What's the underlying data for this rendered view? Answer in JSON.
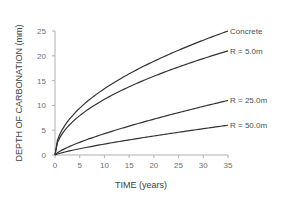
{
  "chart_data": {
    "type": "line",
    "title": "",
    "xlabel": "TIME (years)",
    "ylabel": "DEPTH OF CARBONATION (mm)",
    "xlim": [
      0,
      35
    ],
    "ylim": [
      0,
      25
    ],
    "xticks": [
      0,
      5,
      10,
      15,
      20,
      25,
      30,
      35
    ],
    "yticks": [
      0,
      5,
      10,
      15,
      20,
      25
    ],
    "grid": false,
    "legend_position": "inline labels at right end of curves",
    "x": [
      0,
      1,
      2,
      5,
      10,
      15,
      20,
      25,
      30,
      35
    ],
    "series": [
      {
        "name": "Concrete",
        "values": [
          0,
          4.2,
          6.0,
          9.5,
          13.4,
          16.4,
          18.9,
          21.1,
          23.2,
          25.0
        ]
      },
      {
        "name": "R = 5.0m",
        "values": [
          0,
          3.5,
          5.0,
          7.9,
          11.2,
          13.7,
          15.9,
          17.7,
          19.4,
          21.0
        ]
      },
      {
        "name": "R = 25.0m",
        "values": [
          0,
          0.6,
          1.0,
          2.2,
          4.0,
          5.6,
          7.2,
          8.6,
          9.8,
          11.0
        ]
      },
      {
        "name": "R = 50.0m",
        "values": [
          0,
          0.3,
          0.5,
          1.2,
          2.2,
          3.1,
          3.9,
          4.6,
          5.3,
          6.0
        ]
      }
    ]
  }
}
